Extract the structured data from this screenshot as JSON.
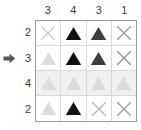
{
  "puzzle": {
    "type": "nonogram-like-grid",
    "rows": 4,
    "cols": 4,
    "column_clues": [
      "3",
      "4",
      "3",
      "1"
    ],
    "row_clues": [
      "2",
      "3",
      "4",
      "2"
    ],
    "pointer": {
      "icon": "arrow-right-icon",
      "points_to_row_index": 1,
      "points_to_row_clue": "3",
      "color": "#595959"
    },
    "colors": {
      "grid_border": "#9a9a9a",
      "cell_border": "#d8d8d8",
      "shaded_row_background": "#f0f0f0",
      "cell_background": "#ffffff",
      "clue_text": "#3a3a3a",
      "filled_black": "#111111",
      "filled_dark": "#3d3d3d",
      "faint_gray": "#d7d7d7",
      "cross_gray": "#9b9b9b",
      "cross_light": "#c9c9c9"
    },
    "cells": [
      [
        {
          "mark": "cross",
          "shade": "cross-light",
          "color": "#c9c9c9"
        },
        {
          "mark": "triangle",
          "shade": "filled-black",
          "color": "#111111"
        },
        {
          "mark": "triangle",
          "shade": "filled-dark",
          "color": "#3d3d3d"
        },
        {
          "mark": "cross",
          "shade": "cross-gray",
          "color": "#9b9b9b"
        }
      ],
      [
        {
          "mark": "triangle",
          "shade": "faint-gray",
          "color": "#dcdcdc"
        },
        {
          "mark": "triangle",
          "shade": "filled-black",
          "color": "#111111"
        },
        {
          "mark": "triangle",
          "shade": "filled-dark",
          "color": "#3d3d3d"
        },
        {
          "mark": "cross",
          "shade": "cross-gray",
          "color": "#8f8f8f"
        }
      ],
      [
        {
          "mark": "triangle",
          "shade": "faint-gray",
          "color": "#dcdcdc"
        },
        {
          "mark": "triangle",
          "shade": "faint-gray",
          "color": "#dcdcdc"
        },
        {
          "mark": "triangle",
          "shade": "faint-gray",
          "color": "#dcdcdc"
        },
        {
          "mark": "triangle",
          "shade": "faint-gray",
          "color": "#dcdcdc"
        }
      ],
      [
        {
          "mark": "triangle",
          "shade": "faint-gray",
          "color": "#dcdcdc"
        },
        {
          "mark": "triangle",
          "shade": "filled-black",
          "color": "#111111"
        },
        {
          "mark": "cross",
          "shade": "cross-light",
          "color": "#b4b4b4"
        },
        {
          "mark": "cross",
          "shade": "cross-gray",
          "color": "#9b9b9b"
        }
      ]
    ],
    "shaded_rows": [
      2
    ]
  }
}
